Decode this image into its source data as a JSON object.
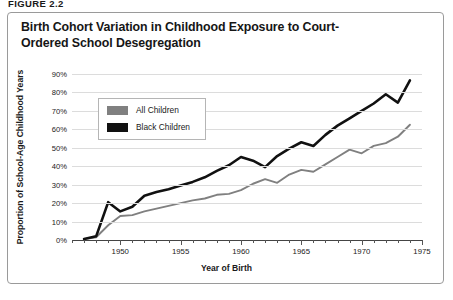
{
  "figure_label": "FIGURE 2.2",
  "chart_data": {
    "type": "line",
    "title": "Birth Cohort Variation in Childhood Exposure to Court-Ordered School Desegregation",
    "xlabel": "Year of Birth",
    "ylabel": "Proportion of School-Age Childhood Years",
    "xlim": [
      1946,
      1975
    ],
    "ylim": [
      0,
      90
    ],
    "grid": true,
    "legend_position": "upper-left-inside",
    "y_ticks": [
      0,
      10,
      20,
      30,
      40,
      50,
      60,
      70,
      80,
      90
    ],
    "y_tick_labels": [
      "0%",
      "10%",
      "20%",
      "30%",
      "40%",
      "50%",
      "60%",
      "70%",
      "80%",
      "90%"
    ],
    "x_major_ticks": [
      1950,
      1955,
      1960,
      1965,
      1970,
      1975
    ],
    "x_major_tick_labels": [
      "1950",
      "1955",
      "1960",
      "1965",
      "1970",
      "1975"
    ],
    "x_minor_tick_step": 1,
    "x": [
      1947,
      1948,
      1949,
      1950,
      1951,
      1952,
      1953,
      1954,
      1955,
      1956,
      1957,
      1958,
      1959,
      1960,
      1961,
      1962,
      1963,
      1964,
      1965,
      1966,
      1967,
      1968,
      1969,
      1970,
      1971,
      1972,
      1973,
      1974
    ],
    "series": [
      {
        "name": "All Children",
        "color": "#808080",
        "values": [
          0.5,
          1.5,
          8.0,
          13.0,
          13.5,
          15.5,
          17.0,
          18.5,
          20.0,
          21.5,
          22.5,
          24.5,
          25.0,
          27.0,
          30.5,
          33.0,
          31.0,
          35.5,
          38.0,
          37.0,
          41.0,
          45.0,
          49.0,
          47.0,
          51.0,
          52.5,
          56.0,
          62.5
        ]
      },
      {
        "name": "Black Children",
        "color": "#111111",
        "values": [
          0.5,
          2.0,
          20.5,
          15.5,
          18.0,
          24.0,
          26.0,
          27.5,
          29.5,
          31.5,
          34.0,
          37.5,
          40.5,
          45.0,
          43.0,
          39.5,
          45.5,
          49.5,
          53.0,
          51.0,
          57.0,
          62.0,
          66.0,
          70.0,
          74.0,
          79.0,
          74.5,
          86.5
        ]
      }
    ]
  }
}
